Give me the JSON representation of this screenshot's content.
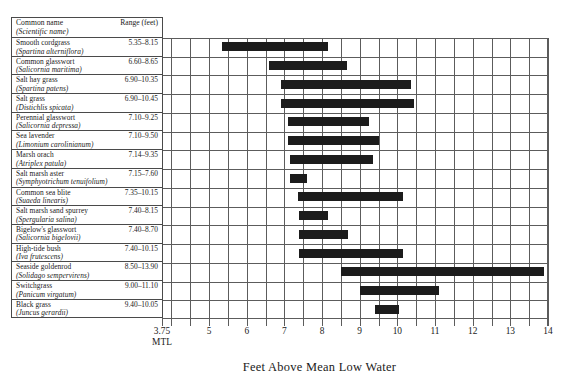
{
  "table": {
    "header": {
      "common_name": "Common name",
      "scientific_name": "(Scientific name)",
      "range": "Range (feet)"
    },
    "rows": [
      {
        "common": "Smooth cordgrass",
        "scientific": "(Spartina alterniflora)",
        "range": "5.35–8.15",
        "low": 5.35,
        "high": 8.15
      },
      {
        "common": "Common glasswort",
        "scientific": "(Salicornia maritima)",
        "range": "6.60–8.65",
        "low": 6.6,
        "high": 8.65
      },
      {
        "common": "Salt hay grass",
        "scientific": "(Spartina patens)",
        "range": "6.90–10.35",
        "low": 6.9,
        "high": 10.35
      },
      {
        "common": "Salt grass",
        "scientific": "(Distichlis spicata)",
        "range": "6.90–10.45",
        "low": 6.9,
        "high": 10.45
      },
      {
        "common": "Perennial glasswort",
        "scientific": "(Salicornia depressa)",
        "range": "7.10–9.25",
        "low": 7.1,
        "high": 9.25
      },
      {
        "common": "Sea lavender",
        "scientific": "(Limonium carolinianum)",
        "range": "7.10–9.50",
        "low": 7.1,
        "high": 9.5
      },
      {
        "common": "Marsh orach",
        "scientific": "(Atriplex patula)",
        "range": "7.14–9.35",
        "low": 7.14,
        "high": 9.35
      },
      {
        "common": "Salt marsh aster",
        "scientific": "(Symphyotrichum tenuifolium)",
        "range": "7.15–7.60",
        "low": 7.15,
        "high": 7.6
      },
      {
        "common": "Common sea blite",
        "scientific": "(Suaeda linearis)",
        "range": "7.35–10.15",
        "low": 7.35,
        "high": 10.15
      },
      {
        "common": "Salt marsh sand spurrey",
        "scientific": "(Spergularia salina)",
        "range": "7.40–8.15",
        "low": 7.4,
        "high": 8.15
      },
      {
        "common": "Bigelow's glasswort",
        "scientific": "(Salicornia bigelovii)",
        "range": "7.40–8.70",
        "low": 7.4,
        "high": 8.7
      },
      {
        "common": "High-tide bush",
        "scientific": "(Iva frutescens)",
        "range": "7.40–10.15",
        "low": 7.4,
        "high": 10.15
      },
      {
        "common": "Seaside goldenrod",
        "scientific": "(Solidago sempervirens)",
        "range": "8.50–13.90",
        "low": 8.5,
        "high": 13.9
      },
      {
        "common": "Switchgrass",
        "scientific": "(Panicum virgatum)",
        "range": "9.00–11.10",
        "low": 9.0,
        "high": 11.1
      },
      {
        "common": "Black grass",
        "scientific": "(Juncus gerardii)",
        "range": "9.40–10.05",
        "low": 9.4,
        "high": 10.05
      }
    ]
  },
  "axis": {
    "title": "Feet Above Mean Low Water",
    "ticks": [
      {
        "label": "3.75",
        "sub": "MTL",
        "value": 3.75
      },
      {
        "label": "5",
        "sub": "",
        "value": 5
      },
      {
        "label": "6",
        "sub": "",
        "value": 6
      },
      {
        "label": "7",
        "sub": "",
        "value": 7
      },
      {
        "label": "8",
        "sub": "",
        "value": 8
      },
      {
        "label": "9",
        "sub": "",
        "value": 9
      },
      {
        "label": "10",
        "sub": "",
        "value": 10
      },
      {
        "label": "11",
        "sub": "",
        "value": 11
      },
      {
        "label": "12",
        "sub": "",
        "value": 12
      },
      {
        "label": "13",
        "sub": "",
        "value": 13
      },
      {
        "label": "14",
        "sub": "",
        "value": 14
      }
    ],
    "min": 3.75,
    "max": 14,
    "gridline_step": 0.5
  },
  "colors": {
    "bar": "#1c1c1c",
    "grid": "#5c5c5c",
    "border": "#4a4a4a",
    "background": "#ffffff",
    "text": "#1a1a1a"
  },
  "chart_data": {
    "type": "bar",
    "orientation": "horizontal",
    "title": "",
    "subtitle": "",
    "xlabel": "Feet Above Mean Low Water",
    "ylabel": "",
    "xlim": [
      3.75,
      14
    ],
    "grid": true,
    "legend": "none",
    "xticks": [
      "3.75 MTL",
      "5",
      "6",
      "7",
      "8",
      "9",
      "10",
      "11",
      "12",
      "13",
      "14"
    ],
    "note": "Each bar is a floating range (low to high) of elevation tolerance per species.",
    "categories": [
      "Smooth cordgrass (Spartina alterniflora)",
      "Common glasswort (Salicornia maritima)",
      "Salt hay grass (Spartina patens)",
      "Salt grass (Distichlis spicata)",
      "Perennial glasswort (Salicornia depressa)",
      "Sea lavender (Limonium carolinianum)",
      "Marsh orach (Atriplex patula)",
      "Salt marsh aster (Symphyotrichum tenuifolium)",
      "Common sea blite (Suaeda linearis)",
      "Salt marsh sand spurrey (Spergularia salina)",
      "Bigelow's glasswort (Salicornia bigelovii)",
      "High-tide bush (Iva frutescens)",
      "Seaside goldenrod (Solidago sempervirens)",
      "Switchgrass (Panicum virgatum)",
      "Black grass (Juncus gerardii)"
    ],
    "ranges": [
      [
        5.35,
        8.15
      ],
      [
        6.6,
        8.65
      ],
      [
        6.9,
        10.35
      ],
      [
        6.9,
        10.45
      ],
      [
        7.1,
        9.25
      ],
      [
        7.1,
        9.5
      ],
      [
        7.14,
        9.35
      ],
      [
        7.15,
        7.6
      ],
      [
        7.35,
        10.15
      ],
      [
        7.4,
        8.15
      ],
      [
        7.4,
        8.7
      ],
      [
        7.4,
        10.15
      ],
      [
        8.5,
        13.9
      ],
      [
        9.0,
        11.1
      ],
      [
        9.4,
        10.05
      ]
    ]
  }
}
